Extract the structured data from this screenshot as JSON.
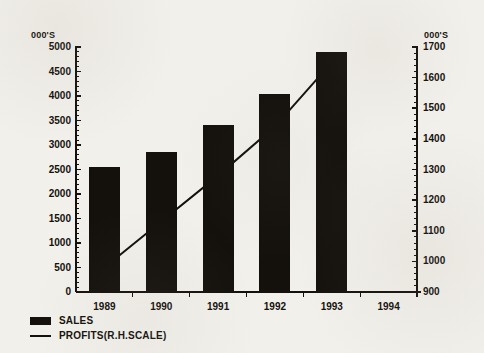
{
  "chart_data": {
    "type": "bar",
    "title": "",
    "categories": [
      "1989",
      "1990",
      "1991",
      "1992",
      "1993",
      "1994"
    ],
    "series": [
      {
        "name": "SALES",
        "type": "bar",
        "axis": "left",
        "values": [
          2550,
          2850,
          3400,
          4050,
          4900,
          null
        ]
      },
      {
        "name": "PROFITS(R.H.SCALE)",
        "type": "line",
        "axis": "right",
        "values": [
          980,
          1130,
          1280,
          1440,
          1650,
          null
        ]
      }
    ],
    "left_axis": {
      "unit_label": "000'S",
      "min": 0,
      "max": 5000,
      "step": 500,
      "minor_ticks_per_step": 5,
      "ticks": [
        "5000",
        "4500",
        "4000",
        "3500",
        "3000",
        "2500",
        "2000",
        "1500",
        "1000",
        "500",
        "0"
      ]
    },
    "right_axis": {
      "unit_label": "000'S",
      "min": 900,
      "max": 1700,
      "step": 100,
      "minor_ticks_per_step": 5,
      "ticks": [
        "1700",
        "1600",
        "1500",
        "1400",
        "1300",
        "1200",
        "1100",
        "1000",
        "900"
      ]
    },
    "xlabel": "",
    "ylabel": "",
    "grid": false,
    "legend_position": "bottom-left",
    "colors": {
      "ink": "#14110d",
      "paper": "#f2f0ea",
      "bar_fill": "#14110d",
      "line_stroke": "#14110d"
    }
  },
  "legend": {
    "items": [
      {
        "label": "SALES",
        "swatch": "filled-box"
      },
      {
        "label": "PROFITS(R.H.SCALE)",
        "swatch": "line"
      }
    ]
  }
}
